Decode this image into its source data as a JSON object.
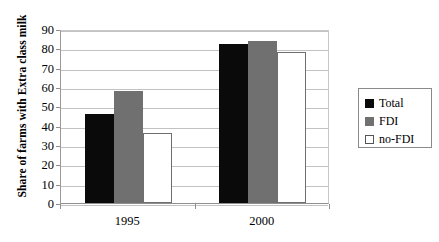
{
  "chart_data": {
    "type": "bar",
    "title": "",
    "xlabel": "",
    "ylabel": "Share of farms with Extra class milk",
    "categories": [
      "1995",
      "2000"
    ],
    "series": [
      {
        "name": "Total",
        "color": "#0a0a0a",
        "values": [
          46,
          82
        ]
      },
      {
        "name": "FDI",
        "color": "#707070",
        "values": [
          58,
          84
        ]
      },
      {
        "name": "no-FDI",
        "color": "#ffffff",
        "values": [
          36,
          78
        ]
      }
    ],
    "ylim": [
      0,
      90
    ],
    "ytick_step": 10,
    "yticks": [
      0,
      10,
      20,
      30,
      40,
      50,
      60,
      70,
      80,
      90
    ],
    "ytick_labels": [
      "0",
      "10",
      "20",
      "30",
      "40",
      "50",
      "60",
      "70",
      "80",
      "90"
    ],
    "grid": true,
    "legend_position": "right",
    "legend_entries": [
      "Total",
      "FDI",
      "no-FDI"
    ]
  }
}
